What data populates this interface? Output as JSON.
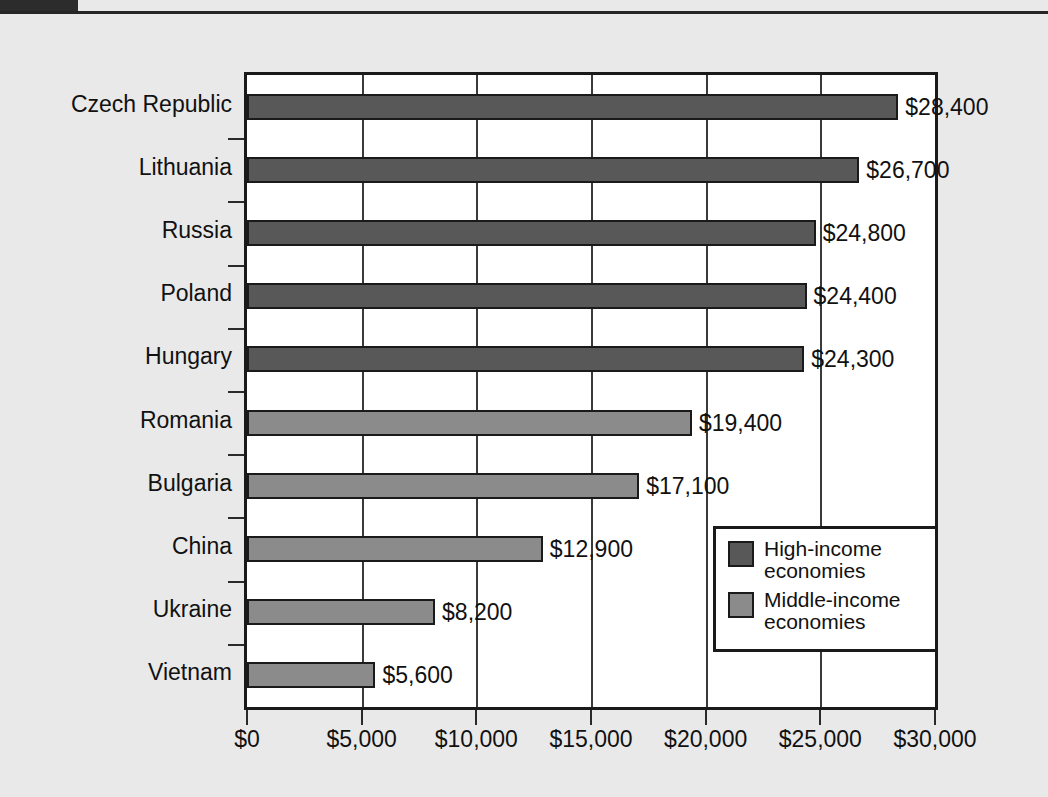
{
  "page": {
    "background_color": "#e9e9e9",
    "corner_block_color": "#2c2c2c",
    "top_rule_color": "#262626"
  },
  "chart_data": {
    "type": "bar",
    "orientation": "horizontal",
    "title": "",
    "subtitle": "",
    "xlabel": "",
    "ylabel": "",
    "xlim": [
      0,
      30000
    ],
    "xticks": [
      0,
      5000,
      10000,
      15000,
      20000,
      25000,
      30000
    ],
    "xtick_labels": [
      "$0",
      "$5,000",
      "$10,000",
      "$15,000",
      "$20,000",
      "$25,000",
      "$30,000"
    ],
    "grid": true,
    "grid_axis": "x",
    "legend_position": "bottom-right",
    "categories": [
      "Czech Republic",
      "Lithuania",
      "Russia",
      "Poland",
      "Hungary",
      "Romania",
      "Bulgaria",
      "China",
      "Ukraine",
      "Vietnam"
    ],
    "values": [
      28400,
      26700,
      24800,
      24400,
      24300,
      19400,
      17100,
      12900,
      8200,
      5600
    ],
    "value_labels": [
      "$28,400",
      "$26,700",
      "$24,800",
      "$24,400",
      "$24,300",
      "$19,400",
      "$17,100",
      "$12,900",
      "$8,200",
      "$5,600"
    ],
    "groups": [
      "high",
      "high",
      "high",
      "high",
      "high",
      "middle",
      "middle",
      "middle",
      "middle",
      "middle"
    ],
    "colors": {
      "high": "#585858",
      "middle": "#8b8b8b",
      "bar_outline": "#1a1a1a",
      "plot_background": "#ffffff",
      "gridline": "#3a3a3a"
    },
    "legend": [
      {
        "key": "high",
        "label": "High-income\neconomies",
        "color": "#585858"
      },
      {
        "key": "middle",
        "label": "Middle-income\neconomies",
        "color": "#8b8b8b"
      }
    ]
  }
}
